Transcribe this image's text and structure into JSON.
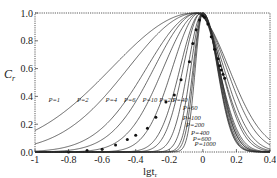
{
  "chart_data": {
    "type": "line",
    "title": "",
    "xlabel": "lgt_r",
    "ylabel": "C_r",
    "xlim": [
      -1.0,
      0.4
    ],
    "ylim": [
      0.0,
      1.0
    ],
    "x_ticks": [
      "-1",
      "-0.8",
      "-0.6",
      "-0.4",
      "-0.2",
      "0",
      "0.2",
      "0.4"
    ],
    "y_ticks": [
      "0.0",
      "0.2",
      "0.4",
      "0.6",
      "0.8",
      "1.0"
    ],
    "grid": false,
    "legend": "inline labels on curves",
    "series": [
      {
        "name": "P=1",
        "label": "P=1",
        "peak_x": -0.05,
        "width": 0.55
      },
      {
        "name": "P=2",
        "label": "P=2",
        "peak_x": -0.04,
        "width": 0.45
      },
      {
        "name": "P=4",
        "label": "P=4",
        "peak_x": -0.03,
        "width": 0.34
      },
      {
        "name": "P=6",
        "label": "P=6",
        "peak_x": -0.03,
        "width": 0.29
      },
      {
        "name": "P=10",
        "label": "P=10",
        "peak_x": -0.02,
        "width": 0.24
      },
      {
        "name": "P=20",
        "label": "P=20",
        "peak_x": -0.02,
        "width": 0.18
      },
      {
        "name": "P=40",
        "label": "P=40",
        "peak_x": -0.01,
        "width": 0.14
      },
      {
        "name": "P=60",
        "label": "P=60",
        "peak_x": -0.01,
        "width": 0.12
      },
      {
        "name": "P=100",
        "label": "P=100",
        "peak_x": 0.0,
        "width": 0.1
      },
      {
        "name": "P=200",
        "label": "P=200",
        "peak_x": 0.0,
        "width": 0.08
      },
      {
        "name": "P=400",
        "label": "P=400",
        "peak_x": 0.0,
        "width": 0.065
      },
      {
        "name": "P=600",
        "label": "P=600",
        "peak_x": 0.0,
        "width": 0.058
      },
      {
        "name": "P=1000",
        "label": "P=1000",
        "peak_x": 0.0,
        "width": 0.05
      }
    ],
    "scatter": {
      "name": "measured",
      "points": [
        [
          -0.8,
          0.0
        ],
        [
          -0.69,
          0.01
        ],
        [
          -0.6,
          0.02
        ],
        [
          -0.52,
          0.05
        ],
        [
          -0.45,
          0.09
        ],
        [
          -0.4,
          0.12
        ],
        [
          -0.33,
          0.17
        ],
        [
          -0.28,
          0.25
        ],
        [
          -0.22,
          0.36
        ],
        [
          -0.17,
          0.41
        ],
        [
          -0.13,
          0.52
        ],
        [
          -0.08,
          0.65
        ],
        [
          -0.06,
          0.78
        ],
        [
          -0.04,
          0.88
        ],
        [
          -0.02,
          0.95
        ],
        [
          0.0,
          0.98
        ],
        [
          0.01,
          0.97
        ],
        [
          0.03,
          0.92
        ],
        [
          0.05,
          0.83
        ],
        [
          0.07,
          0.74
        ],
        [
          0.09,
          0.67
        ],
        [
          0.1,
          0.62
        ],
        [
          0.11,
          0.59
        ],
        [
          0.12,
          0.56
        ],
        [
          0.13,
          0.53
        ]
      ]
    }
  },
  "labels": {
    "y_axis": "C",
    "y_axis_sub": "r",
    "x_axis": "lgt",
    "x_axis_sub": "r"
  }
}
